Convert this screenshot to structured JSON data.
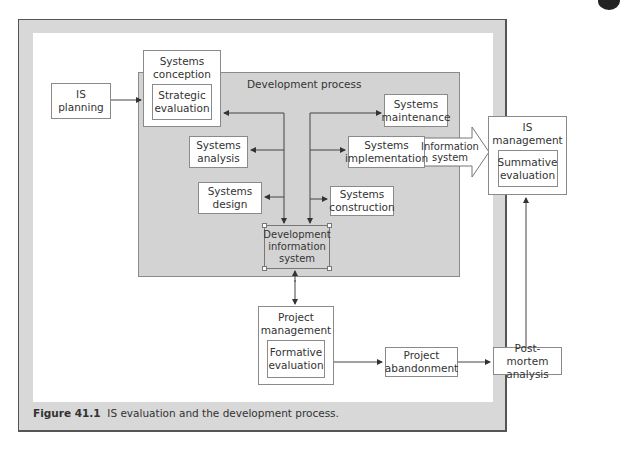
{
  "figure": {
    "caption_label": "Figure 41.1",
    "caption_text": "IS evaluation and the development process."
  },
  "nodes": {
    "is_planning": "IS\nplanning",
    "systems_conception": "Systems\nconception",
    "strategic_evaluation": "Strategic\nevaluation",
    "development_process": "Development process",
    "systems_analysis": "Systems\nanalysis",
    "systems_design": "Systems\ndesign",
    "systems_maintenance": "Systems\nmaintenance",
    "systems_implementation": "Systems\nimplementation",
    "systems_construction": "Systems\nconstruction",
    "development_information_system": "Development\ninformation\nsystem",
    "information_system": "Information\nsystem",
    "is_management": "IS\nmanagement",
    "summative_evaluation": "Summative\nevaluation",
    "project_management": "Project\nmanagement",
    "formative_evaluation": "Formative\nevaluation",
    "project_abandonment": "Project\nabandonment",
    "post_mortem_analysis": "Post-mortem\nanalysis"
  },
  "colors": {
    "frame_bg": "#d8d8d8",
    "process_bg": "#d3d3d3",
    "box_border": "#8a8a8a",
    "line": "#444444"
  }
}
